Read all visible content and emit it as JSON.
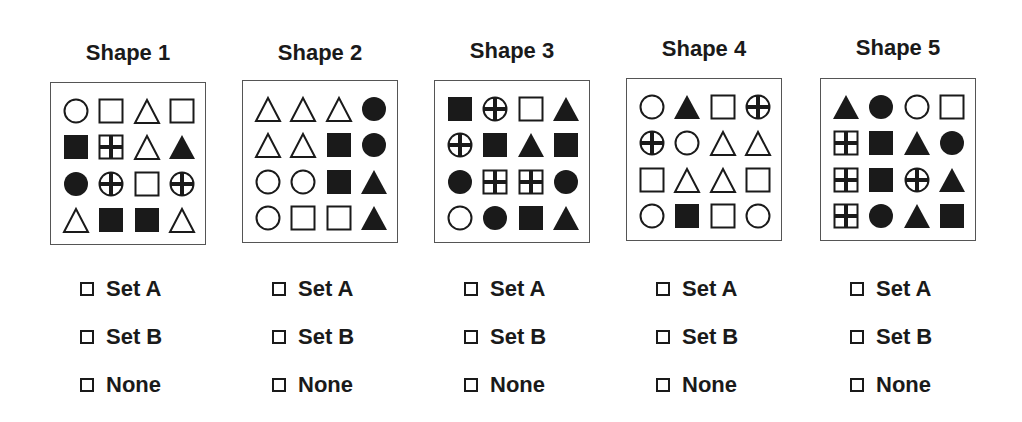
{
  "options": [
    "Set A",
    "Set B",
    "None"
  ],
  "legend": {
    "oc": "open-circle",
    "fc": "filled-circle",
    "os": "open-square",
    "fs": "filled-square",
    "ot": "open-triangle",
    "ft": "filled-triangle",
    "xc": "cross-circle",
    "xs": "cross-square"
  },
  "shapes": [
    {
      "title": "Shape 1",
      "left": 50,
      "title_top": 40,
      "panel_top": 82,
      "grid": [
        [
          "oc",
          "os",
          "ot",
          "os"
        ],
        [
          "fs",
          "xs",
          "ot",
          "ft"
        ],
        [
          "fc",
          "xc",
          "os",
          "xc"
        ],
        [
          "ot",
          "fs",
          "fs",
          "ot"
        ]
      ]
    },
    {
      "title": "Shape 2",
      "left": 242,
      "title_top": 40,
      "panel_top": 80,
      "grid": [
        [
          "ot",
          "ot",
          "ot",
          "fc"
        ],
        [
          "ot",
          "ot",
          "fs",
          "fc"
        ],
        [
          "oc",
          "oc",
          "fs",
          "ft"
        ],
        [
          "oc",
          "os",
          "os",
          "ft"
        ]
      ]
    },
    {
      "title": "Shape 3",
      "left": 434,
      "title_top": 38,
      "panel_top": 80,
      "grid": [
        [
          "fs",
          "xc",
          "os",
          "ft"
        ],
        [
          "xc",
          "fs",
          "ft",
          "fs"
        ],
        [
          "fc",
          "xs",
          "xs",
          "fc"
        ],
        [
          "oc",
          "fc",
          "fs",
          "ft"
        ]
      ]
    },
    {
      "title": "Shape 4",
      "left": 626,
      "title_top": 36,
      "panel_top": 78,
      "grid": [
        [
          "oc",
          "ft",
          "os",
          "xc"
        ],
        [
          "xc",
          "oc",
          "ot",
          "ot"
        ],
        [
          "os",
          "ot",
          "ot",
          "os"
        ],
        [
          "oc",
          "fs",
          "os",
          "oc"
        ]
      ]
    },
    {
      "title": "Shape 5",
      "left": 820,
      "title_top": 35,
      "panel_top": 78,
      "grid": [
        [
          "ft",
          "fc",
          "oc",
          "os"
        ],
        [
          "xs",
          "fs",
          "ft",
          "fc"
        ],
        [
          "xs",
          "fs",
          "xc",
          "ft"
        ],
        [
          "xs",
          "fc",
          "ft",
          "fs"
        ]
      ]
    }
  ],
  "colors": {
    "ink": "#1a1a1a",
    "border": "#555555",
    "background": "#ffffff"
  }
}
